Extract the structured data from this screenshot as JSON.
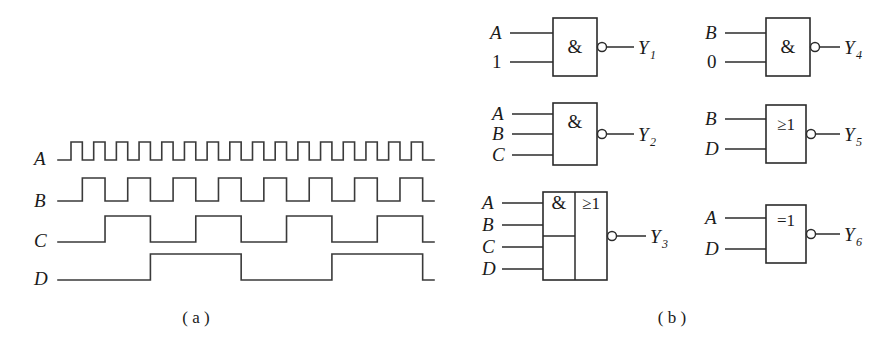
{
  "figure": {
    "panels": [
      {
        "id": "a",
        "caption": "( a )",
        "kind": "timing-waveforms"
      },
      {
        "id": "b",
        "caption": "( b )",
        "kind": "logic-gates"
      }
    ]
  },
  "waveforms": {
    "signals": [
      {
        "name": "A",
        "label": "A",
        "period_units": 2,
        "pulses": 8,
        "description": "Square wave, 8 full high pulses, duty 50%",
        "sequence": [
          0,
          1,
          0,
          1,
          0,
          1,
          0,
          1,
          0,
          1,
          0,
          1,
          0,
          1,
          0,
          1,
          0,
          1,
          0,
          1,
          0,
          1,
          0,
          1,
          0,
          1,
          0,
          1,
          0,
          1,
          0,
          1,
          0
        ]
      },
      {
        "name": "B",
        "label": "B",
        "period_units": 4,
        "pulses": 4,
        "description": "Half frequency of A, 4 full high pulses",
        "sequence": [
          0,
          0,
          1,
          1,
          0,
          0,
          1,
          1,
          0,
          0,
          1,
          1,
          0,
          0,
          1,
          1,
          0,
          0,
          1,
          1,
          0,
          0,
          1,
          1,
          0,
          0,
          1,
          1,
          0,
          0,
          1,
          1,
          0
        ]
      },
      {
        "name": "C",
        "label": "C",
        "period_units": 8,
        "pulses": 2,
        "description": "Quarter frequency of A, 2 full high pulses",
        "sequence": [
          0,
          0,
          0,
          0,
          1,
          1,
          1,
          1,
          0,
          0,
          0,
          0,
          1,
          1,
          1,
          1,
          0,
          0,
          0,
          0,
          1,
          1,
          1,
          1,
          0,
          0,
          0,
          0,
          1,
          1,
          1,
          1,
          0
        ]
      },
      {
        "name": "D",
        "label": "D",
        "period_units": 16,
        "pulses": 1,
        "description": "Eighth frequency of A, single high pulse in second half",
        "sequence": [
          0,
          0,
          0,
          0,
          0,
          0,
          0,
          0,
          1,
          1,
          1,
          1,
          1,
          1,
          1,
          1,
          0,
          0,
          0,
          0,
          0,
          0,
          0,
          0,
          1,
          1,
          1,
          1,
          1,
          1,
          1,
          1,
          0
        ]
      }
    ],
    "stroke_color": "#3a3a3a"
  },
  "gates": [
    {
      "id": "Y1",
      "symbol": "&",
      "symbol_name": "and-symbol",
      "type": "NAND",
      "inverted_output": true,
      "inputs": [
        "A",
        "1"
      ],
      "input_kinds": [
        "signal",
        "constant"
      ],
      "output_label": "Y",
      "output_sub": "1"
    },
    {
      "id": "Y2",
      "symbol": "&",
      "symbol_name": "and-symbol",
      "type": "NAND",
      "inverted_output": true,
      "inputs": [
        "A",
        "B",
        "C"
      ],
      "input_kinds": [
        "signal",
        "signal",
        "signal"
      ],
      "output_label": "Y",
      "output_sub": "2"
    },
    {
      "id": "Y3",
      "symbol": "&",
      "symbol2": "≥1",
      "symbol_name": "and-or-invert-symbol",
      "type": "AND-OR-INVERT",
      "inverted_output": true,
      "inputs": [
        "A",
        "B",
        "C",
        "D"
      ],
      "input_kinds": [
        "signal",
        "signal",
        "signal",
        "signal"
      ],
      "output_label": "Y",
      "output_sub": "3"
    },
    {
      "id": "Y4",
      "symbol": "&",
      "symbol_name": "and-symbol",
      "type": "NAND",
      "inverted_output": true,
      "inputs": [
        "B",
        "0"
      ],
      "input_kinds": [
        "signal",
        "constant"
      ],
      "output_label": "Y",
      "output_sub": "4"
    },
    {
      "id": "Y5",
      "symbol": "≥1",
      "symbol_name": "or-symbol",
      "type": "NOR",
      "inverted_output": true,
      "inputs": [
        "B",
        "D"
      ],
      "input_kinds": [
        "signal",
        "signal"
      ],
      "output_label": "Y",
      "output_sub": "5"
    },
    {
      "id": "Y6",
      "symbol": "=1",
      "symbol_name": "xor-symbol",
      "type": "XNOR",
      "inverted_output": true,
      "inputs": [
        "A",
        "D"
      ],
      "input_kinds": [
        "signal",
        "signal"
      ],
      "output_label": "Y",
      "output_sub": "6"
    }
  ],
  "colors": {
    "background": "#ffffff",
    "ink": "#1a1a1a",
    "line": "#2b2b2b",
    "wave": "#3a3a3a"
  }
}
